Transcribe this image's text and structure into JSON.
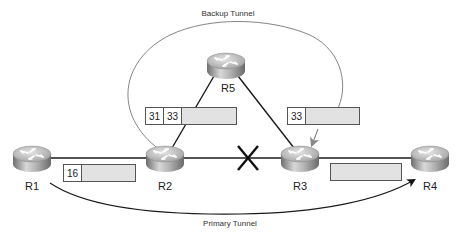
{
  "diagram": {
    "tunnels": {
      "backup": "Backup Tunnel",
      "primary": "Primary Tunnel"
    },
    "routers": [
      {
        "id": "R1",
        "label": "R1"
      },
      {
        "id": "R2",
        "label": "R2"
      },
      {
        "id": "R3",
        "label": "R3"
      },
      {
        "id": "R4",
        "label": "R4"
      },
      {
        "id": "R5",
        "label": "R5"
      }
    ],
    "label_stacks": [
      {
        "location": "R1-R2 link",
        "labels": [
          "16"
        ]
      },
      {
        "location": "R2-R5 link",
        "labels": [
          "31",
          "33"
        ]
      },
      {
        "location": "R5-R3 link",
        "labels": [
          "33"
        ]
      },
      {
        "location": "R3-R4 link",
        "labels": []
      }
    ],
    "failed_link": {
      "between": [
        "R2",
        "R3"
      ],
      "marker": "X"
    },
    "colors": {
      "link": "#1a1a1a",
      "backup_arc": "#777777",
      "payload_fill": "#e2e2e2",
      "router_body": "#9a9a9a"
    }
  }
}
